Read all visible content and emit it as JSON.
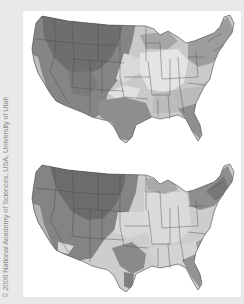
{
  "figure": {
    "credit": "© 2006 National Academy of Sciences, USA, University of Utah",
    "maps": [
      {
        "id": "top",
        "subject": "contiguous-united-states",
        "style": "grayscale-shaded-choropleth",
        "shading": {
          "darkest": "#6b6b6b",
          "dark": "#858585",
          "medium": "#a3a3a3",
          "light": "#c6c6c6",
          "lightest": "#e2e2e2"
        }
      },
      {
        "id": "bottom",
        "subject": "contiguous-united-states",
        "style": "grayscale-shaded-choropleth",
        "shading": {
          "darkest": "#6b6b6b",
          "dark": "#858585",
          "medium": "#a3a3a3",
          "light": "#c6c6c6",
          "lightest": "#e2e2e2"
        }
      }
    ]
  },
  "colors": {
    "page_background": "#e9e9e9",
    "panel_background": "#ffffff",
    "border_lines": "#4a4a4a",
    "credit_text": "#8a8a8a"
  }
}
